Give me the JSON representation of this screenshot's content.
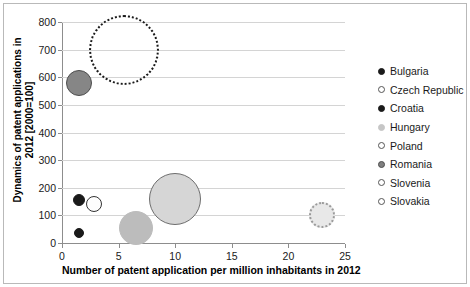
{
  "chart_data": {
    "type": "scatter",
    "title": "",
    "xlabel": "Number of patent application per million inhabitants in 2012",
    "ylabel": "Dynamics of patent applications in 2012 [2000=100]",
    "xlim": [
      0,
      25
    ],
    "ylim": [
      0,
      800
    ],
    "xticks": [
      "0",
      "5",
      "10",
      "15",
      "20",
      "25"
    ],
    "yticks": [
      "0",
      "100",
      "200",
      "300",
      "400",
      "500",
      "600",
      "700",
      "800"
    ],
    "grid": true,
    "legend_position": "right",
    "series": [
      {
        "name": "Bulgaria",
        "x": 1.5,
        "y": 155,
        "size": 12,
        "fill": "#1a1a1a",
        "stroke": "#1a1a1a",
        "stroke_style": "solid"
      },
      {
        "name": "Czech Republic",
        "x": 2.8,
        "y": 140,
        "size": 16,
        "fill": "#fdfdfd",
        "stroke": "#333333",
        "stroke_style": "solid"
      },
      {
        "name": "Croatia",
        "x": 1.5,
        "y": 35,
        "size": 10,
        "fill": "#1a1a1a",
        "stroke": "#1a1a1a",
        "stroke_style": "solid"
      },
      {
        "name": "Hungary",
        "x": 6.5,
        "y": 55,
        "size": 34,
        "fill": "#bcbcbc",
        "stroke": "#bcbcbc",
        "stroke_style": "solid"
      },
      {
        "name": "Poland",
        "x": 10.0,
        "y": 160,
        "size": 52,
        "fill": "#d6d6d6",
        "stroke": "#6e6e6e",
        "stroke_style": "solid"
      },
      {
        "name": "Romania",
        "x": 1.5,
        "y": 580,
        "size": 26,
        "fill": "#868686",
        "stroke": "#4d4d4d",
        "stroke_style": "solid"
      },
      {
        "name": "Slovenia",
        "x": 5.5,
        "y": 700,
        "size": 70,
        "fill": "transparent",
        "stroke": "#1a1a1a",
        "stroke_style": "dotted"
      },
      {
        "name": "Slovakia",
        "x": 23.0,
        "y": 100,
        "size": 26,
        "fill": "#e8e8e8",
        "stroke": "#9a9a9a",
        "stroke_style": "dotted"
      }
    ],
    "legend": [
      {
        "label": "Bulgaria",
        "fill": "#1a1a1a",
        "stroke": "#1a1a1a",
        "stroke_style": "solid"
      },
      {
        "label": "Czech Republic",
        "fill": "#ffffff",
        "stroke": "#555555",
        "stroke_style": "solid"
      },
      {
        "label": "Croatia",
        "fill": "#1a1a1a",
        "stroke": "#1a1a1a",
        "stroke_style": "solid"
      },
      {
        "label": "Hungary",
        "fill": "#c6c6c6",
        "stroke": "#c6c6c6",
        "stroke_style": "solid"
      },
      {
        "label": "Poland",
        "fill": "#ffffff",
        "stroke": "#555555",
        "stroke_style": "solid"
      },
      {
        "label": "Romania",
        "fill": "#808080",
        "stroke": "#4d4d4d",
        "stroke_style": "solid"
      },
      {
        "label": "Slovenia",
        "fill": "#ffffff",
        "stroke": "#555555",
        "stroke_style": "solid"
      },
      {
        "label": "Slovakia",
        "fill": "#ffffff",
        "stroke": "#555555",
        "stroke_style": "solid"
      }
    ]
  }
}
